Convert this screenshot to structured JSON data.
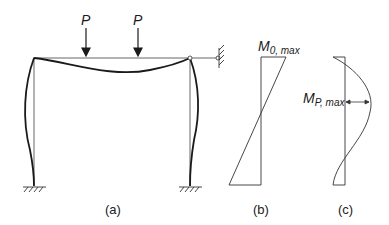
{
  "figure": {
    "loads": [
      {
        "label": "P"
      },
      {
        "label": "P"
      }
    ],
    "moment_b": {
      "main": "M",
      "sub": "0, max"
    },
    "moment_c": {
      "main": "M",
      "sub": "P, max"
    },
    "captions": {
      "a": "(a)",
      "b": "(b)",
      "c": "(c)"
    },
    "colors": {
      "line": "#1a1a1a",
      "thin": "#555555"
    }
  }
}
